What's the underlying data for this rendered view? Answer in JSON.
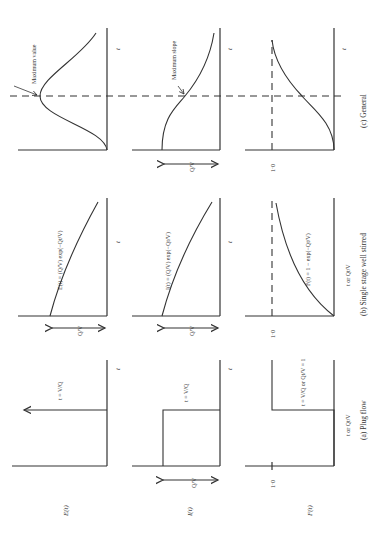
{
  "figure": {
    "orientation": "rotated-90-ccw",
    "row_labels": [
      "E(t)",
      "I(t)",
      "F(t)"
    ],
    "columns": [
      {
        "id": "plug",
        "caption": "(a) Plug flow",
        "x_label": "t or Qt/V",
        "E": {
          "type": "impulse",
          "annotation": "t = V/Q",
          "axis_t": "t"
        },
        "I": {
          "type": "step-down",
          "annotation": "t = V/Q",
          "height_label": "Q/V",
          "axis_t": "t"
        },
        "F": {
          "type": "step-up",
          "annotation": "t = V/Q or Qt/V = 1",
          "level_label": "1·0"
        }
      },
      {
        "id": "stirred",
        "caption": "(b) Single stage well stirred",
        "x_label": "t or Qt/V",
        "E": {
          "type": "exp-decay",
          "formula": "E(t) = Q/V exp(−Qt/V)",
          "height_label": "Q/V",
          "axis_t": "t"
        },
        "I": {
          "type": "exp-decay",
          "formula": "I(t) = Q/V exp(−Qt/V)",
          "height_label": "Q/V",
          "axis_t": "t"
        },
        "F": {
          "type": "exp-rise",
          "formula": "F(t) = 1 − exp(−Qt/V)",
          "level_label": "1·0"
        }
      },
      {
        "id": "general",
        "caption": "(c) General",
        "E": {
          "type": "peak",
          "annotation": "Maximum value",
          "axis_t": "t"
        },
        "I": {
          "type": "sigmoid-down",
          "annotation": "Maximum slope",
          "height_label": "Q/V",
          "axis_t": "t"
        },
        "F": {
          "type": "sigmoid-up",
          "level_label": "1·0"
        }
      }
    ],
    "text": {
      "E_row": "E(t)",
      "I_row": "I(t)",
      "F_row": "F(t)",
      "t": "t",
      "QV": "Q/V",
      "one": "1·0",
      "a_ann": "t = V/Q",
      "a_F_ann": "t = V/Q  or  Qt/V = 1",
      "a_xlabel": "t or Qt/V",
      "b_xlabel": "t or Qt/V",
      "b_E": "E(t) = (Q/V) exp(−Qt/V)",
      "b_I": "I(t) = (Q/V) exp(−Qt/V)",
      "b_F": "F(t) = 1 − exp(−Qt/V)",
      "c_max_value": "Maximum value",
      "c_max_slope": "Maximum slope",
      "cap_a": "(a) Plug flow",
      "cap_b": "(b) Single stage well stirred",
      "cap_c": "(c) General"
    }
  }
}
